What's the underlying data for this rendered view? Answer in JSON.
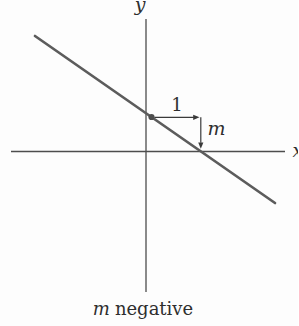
{
  "figure": {
    "description_caption": "m negative",
    "labels": {
      "y_axis": "y",
      "x_axis": "x",
      "run": "1",
      "rise": "m"
    },
    "caption": {
      "variable": "m",
      "rest": "negative"
    },
    "colors": {
      "background": "#fdfdfd",
      "axis": "#4d4d4d",
      "slope_line": "#5c5c5c",
      "ink": "#2e2e2e"
    },
    "geometry_semantics": {
      "line_slope_sign": "negative",
      "run_value": "1",
      "rise_value": "m"
    }
  }
}
